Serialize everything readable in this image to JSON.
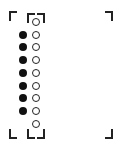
{
  "layout": {
    "outer_frame": {
      "left": 9,
      "top": 11,
      "right": 113,
      "bottom": 139
    },
    "inner_frame": {
      "left": 27,
      "top": 13,
      "right": 45,
      "bottom": 139
    },
    "row_start_y": 22,
    "row_step": 12.7,
    "filled_x": 23,
    "open_x": 36
  },
  "rows": [
    {
      "filled": false,
      "open": true
    },
    {
      "filled": true,
      "open": true
    },
    {
      "filled": true,
      "open": true
    },
    {
      "filled": true,
      "open": true
    },
    {
      "filled": true,
      "open": true
    },
    {
      "filled": true,
      "open": true
    },
    {
      "filled": true,
      "open": true
    },
    {
      "filled": true,
      "open": true
    },
    {
      "filled": false,
      "open": true
    }
  ],
  "colors": {
    "ink": "#222222",
    "fill": "#111111",
    "background": "#ffffff"
  }
}
